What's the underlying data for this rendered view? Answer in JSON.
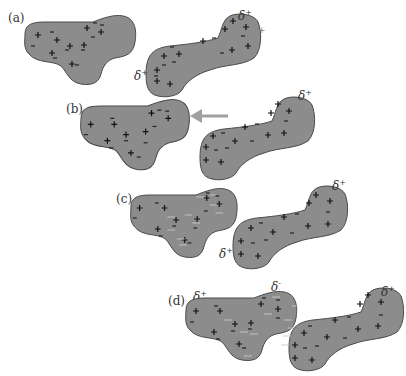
{
  "panels": [
    {
      "id": "a",
      "label": "(a)",
      "delta_right": "δ",
      "delta_right_sign": "+",
      "delta_left": "δ",
      "delta_left_sign": "+",
      "stray_charge": "+"
    },
    {
      "id": "b",
      "label": "(b)",
      "delta_right": "δ",
      "delta_right_sign": "+",
      "arrow": "approach-left"
    },
    {
      "id": "c",
      "label": "(c)",
      "delta_right": "δ",
      "delta_right_sign": "+",
      "delta_left": "δ",
      "delta_left_sign": "+"
    },
    {
      "id": "d",
      "label": "(d)",
      "delta_left_blob": "δ",
      "delta_left_blob_sign": "+",
      "delta_mid": "δ",
      "delta_mid_sign": "-",
      "delta_right": "δ",
      "delta_right_sign": "+"
    }
  ],
  "colors": {
    "blob_fill": "#8c8c8c",
    "blob_stroke": "#4a4a4a",
    "arrow": "#a0a0a0",
    "induced_dipole_lines": "#c8c8c8"
  }
}
